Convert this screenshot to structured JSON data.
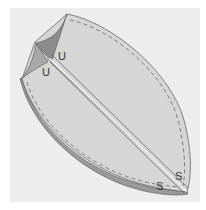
{
  "diagram": {
    "colors": {
      "background": "#ffffff",
      "panel": "#ededed",
      "fabric_face": "#d6d6d6",
      "fabric_edge": "#9a9a9a",
      "inner_fold": "#8c8c8c",
      "outline": "#555555",
      "stitch": "#555555"
    },
    "labels": [
      {
        "id": "u-upper",
        "text": "U",
        "x": 61,
        "y": 58
      },
      {
        "id": "u-lower",
        "text": "U",
        "x": 44,
        "y": 75
      },
      {
        "id": "s-right",
        "text": "S",
        "x": 177,
        "y": 179
      },
      {
        "id": "s-left",
        "text": "S",
        "x": 157,
        "y": 189
      }
    ]
  }
}
